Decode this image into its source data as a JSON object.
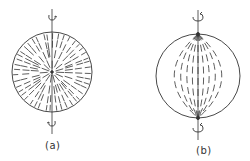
{
  "figure": {
    "panels": [
      {
        "id": "a",
        "label": "(a)",
        "description": "Sphere with radially oriented dashes from center point; rotation axis vertical",
        "center": [
          52,
          72
        ],
        "radius": 40
      },
      {
        "id": "b",
        "label": "(b)",
        "description": "Sphere with meridional (bipolar) dash lines converging at poles; rotation axis vertical",
        "center": [
          198,
          77
        ],
        "radius": 42
      }
    ],
    "stroke_color": "#333333",
    "background": "#ffffff"
  }
}
